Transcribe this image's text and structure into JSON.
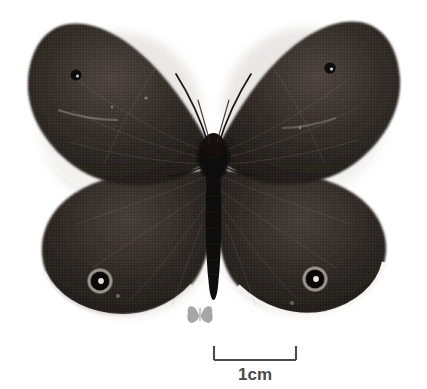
{
  "plate": {
    "background_color": "#ffffff",
    "width": 427,
    "height": 389,
    "subject_name": "butterfly-specimen-dorsal"
  },
  "specimen": {
    "common_description": "pinned dark brown satyrine butterfly, wings spread, dorsal view",
    "wing_color": "#2b2622",
    "wing_color_light": "#4a423c",
    "body_color": "#120f0d",
    "shadow_color": "#d8d6d3",
    "fringe_color": "#f2f0ee",
    "eyespot_ring_color": "#9b948c",
    "eyespot_core_color": "#0a0908",
    "eyespot_pupil_color": "#f6f5f3",
    "parts": [
      {
        "name": "left-forewing",
        "label": "Left forewing"
      },
      {
        "name": "right-forewing",
        "label": "Right forewing"
      },
      {
        "name": "left-hindwing",
        "label": "Left hindwing"
      },
      {
        "name": "right-hindwing",
        "label": "Right hindwing"
      },
      {
        "name": "thorax",
        "label": "Thorax"
      },
      {
        "name": "abdomen",
        "label": "Abdomen"
      },
      {
        "name": "left-antenna",
        "label": "Left antenna"
      },
      {
        "name": "right-antenna",
        "label": "Right antenna"
      }
    ],
    "eyespots": [
      {
        "name": "left-hindwing-ocellus",
        "cx": 100,
        "cy": 281,
        "r": 13
      },
      {
        "name": "right-hindwing-ocellus",
        "cx": 315,
        "cy": 279,
        "r": 13
      },
      {
        "name": "left-forewing-ocellus",
        "cx": 76,
        "cy": 75,
        "r": 5
      },
      {
        "name": "right-forewing-ocellus",
        "cx": 330,
        "cy": 69,
        "r": 5
      }
    ]
  },
  "icon": {
    "name": "butterfly-silhouette-icon",
    "color": "#a6a6a6",
    "alt_text": "butterfly silhouette marker"
  },
  "scalebar": {
    "label": "1cm",
    "line_color": "#4a4a4a",
    "text_color": "#4a4a4a",
    "length_px": 83,
    "tick_height_px": 14
  }
}
